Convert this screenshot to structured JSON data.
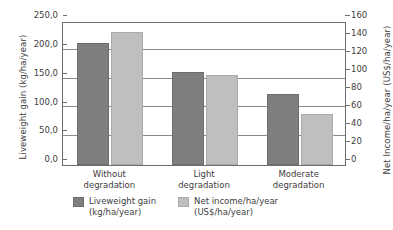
{
  "chart_data": {
    "type": "bar",
    "title": "",
    "categories": [
      "Without degradation",
      "Light degradation",
      "Moderate degradation"
    ],
    "category_lines": [
      [
        "Without",
        "degradation"
      ],
      [
        "Light",
        "degradation"
      ],
      [
        "Moderate",
        "degradation"
      ]
    ],
    "series": [
      {
        "name": "Liveweight gain",
        "unit": "(kg/ha/year)",
        "axis": "left",
        "color": "#7f7f7f",
        "values": [
          212,
          162,
          124
        ]
      },
      {
        "name": "Net income/ha/year",
        "unit": "(US$/ha/year)",
        "axis": "right",
        "color": "#bfbfbf",
        "values": [
          148,
          100,
          57
        ]
      }
    ],
    "ylabel_left": "Liveweight gain (kg/ha/year)",
    "ylabel_right": "Net Income/ha/year (US$/ha/year)",
    "xlabel": "",
    "ylim_left": [
      0,
      250
    ],
    "ylim_right": [
      0,
      160
    ],
    "yticks_left": [
      0,
      50,
      100,
      150,
      200,
      250
    ],
    "yticks_left_labels": [
      "0,0",
      "50,0",
      "100,0",
      "150,0",
      "200,0",
      "250,0"
    ],
    "yticks_right": [
      0,
      20,
      40,
      60,
      80,
      100,
      120,
      140,
      160
    ],
    "yticks_right_labels": [
      "0",
      "20",
      "40",
      "60",
      "80",
      "100",
      "120",
      "140",
      "160"
    ],
    "gridlines_left": [
      50,
      100,
      150,
      200
    ],
    "grid": true,
    "legend_position": "bottom",
    "background_color": "#ffffff",
    "axis_color": "#6d6d6d",
    "grid_color": "#8a8a8a"
  }
}
